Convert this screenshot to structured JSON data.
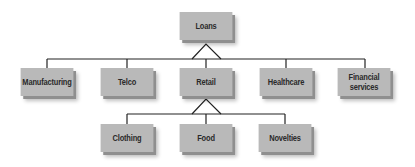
{
  "diagram": {
    "type": "hierarchy",
    "root": {
      "label": "Loans",
      "children": [
        {
          "label": "Manufacturing"
        },
        {
          "label": "Telco"
        },
        {
          "label": "Retail",
          "children": [
            {
              "label": "Clothing"
            },
            {
              "label": "Food"
            },
            {
              "label": "Novelties"
            }
          ]
        },
        {
          "label": "Healthcare"
        },
        {
          "label": "Financial\nservices"
        }
      ]
    },
    "colors": {
      "node_fill": "#b9b9b9",
      "line": "#222222"
    }
  }
}
